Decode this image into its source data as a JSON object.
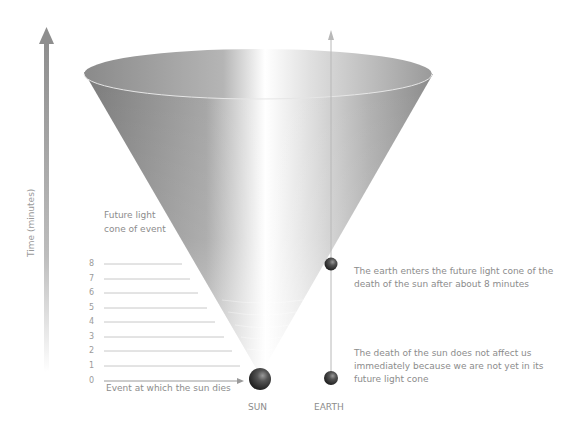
{
  "diagram": {
    "axis": {
      "label": "Time (minutes)",
      "ticks": [
        "0",
        "1",
        "2",
        "3",
        "4",
        "5",
        "6",
        "7",
        "8"
      ]
    },
    "cone_label": [
      "Future light",
      "cone of event"
    ],
    "event_label": "Event at which the sun dies",
    "objects": {
      "sun": "SUN",
      "earth": "EARTH"
    },
    "notes": {
      "earth_enters": "The earth enters the future light cone of the death of the sun after about 8 minutes",
      "not_affected": "The death of the sun does not affect us immediately because we are not yet in its future light cone"
    },
    "colors": {
      "cone_dark": "#6e6e6e",
      "cone_light": "#ffffff",
      "text": "#8c8c8c",
      "arrow": "#9a9a9a"
    }
  }
}
